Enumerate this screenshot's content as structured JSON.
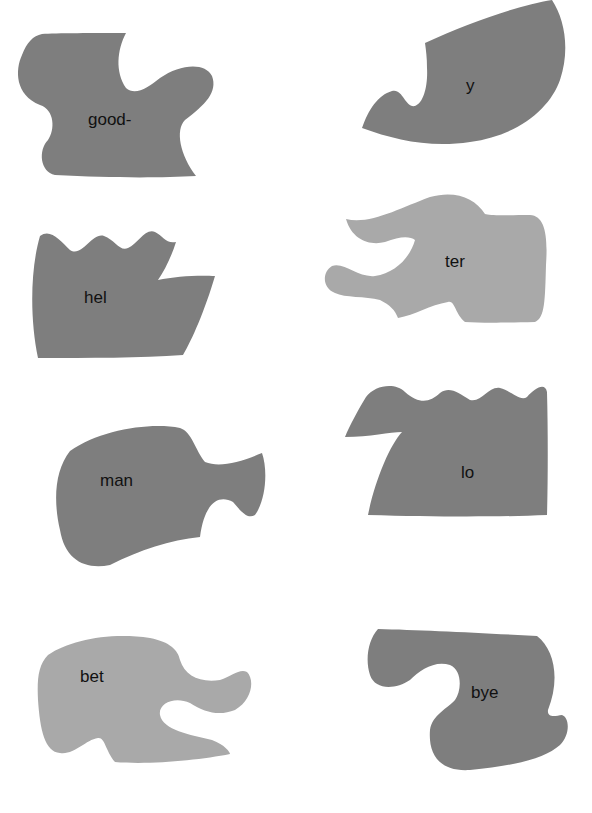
{
  "worksheet": {
    "pieces": [
      {
        "id": "good",
        "label": "good-",
        "shade": "dark"
      },
      {
        "id": "y",
        "label": "y",
        "shade": "dark"
      },
      {
        "id": "hel",
        "label": "hel",
        "shade": "dark"
      },
      {
        "id": "ter",
        "label": "ter",
        "shade": "light"
      },
      {
        "id": "man",
        "label": "man",
        "shade": "dark"
      },
      {
        "id": "lo",
        "label": "lo",
        "shade": "dark"
      },
      {
        "id": "bet",
        "label": "bet",
        "shade": "light"
      },
      {
        "id": "bye",
        "label": "bye",
        "shade": "dark"
      }
    ]
  },
  "colors": {
    "dark_piece": "#7e7e7e",
    "light_piece": "#a9a9a9",
    "background": "#ffffff",
    "text": "#111111"
  }
}
